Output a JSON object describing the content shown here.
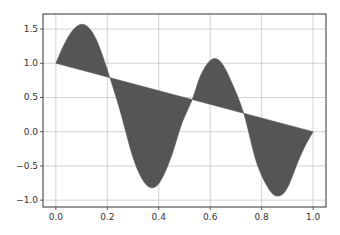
{
  "chart_data": {
    "type": "area",
    "title": "",
    "xlabel": "",
    "ylabel": "",
    "xlim": [
      -0.05,
      1.05
    ],
    "ylim": [
      -1.1,
      1.72
    ],
    "grid": true,
    "legend": null,
    "fill_color": "#555555",
    "x_ticks": [
      0.0,
      0.2,
      0.4,
      0.6,
      0.8,
      1.0
    ],
    "x_tick_labels": [
      "0.0",
      "0.2",
      "0.4",
      "0.6",
      "0.8",
      "1.0"
    ],
    "y_ticks": [
      -1.0,
      -0.5,
      0.0,
      0.5,
      1.0,
      1.5
    ],
    "y_tick_labels": [
      "−1.0",
      "−0.5",
      "0.0",
      "0.5",
      "1.0",
      "1.5"
    ],
    "series": [
      {
        "name": "curve",
        "x": [
          0.0,
          0.025,
          0.05,
          0.075,
          0.1,
          0.125,
          0.15,
          0.175,
          0.21,
          0.25,
          0.3,
          0.34,
          0.376,
          0.41,
          0.45,
          0.49,
          0.53,
          0.56,
          0.59,
          0.617,
          0.645,
          0.68,
          0.73,
          0.78,
          0.83,
          0.866,
          0.9,
          0.94,
          0.97,
          1.0
        ],
        "y": [
          1.0,
          1.22,
          1.4,
          1.52,
          1.57,
          1.53,
          1.4,
          1.18,
          0.79,
          0.3,
          -0.38,
          -0.72,
          -0.82,
          -0.7,
          -0.35,
          0.12,
          0.47,
          0.8,
          1.0,
          1.07,
          1.0,
          0.75,
          0.27,
          -0.45,
          -0.85,
          -0.94,
          -0.82,
          -0.45,
          -0.2,
          0.0
        ]
      },
      {
        "name": "line",
        "x": [
          0.0,
          1.0
        ],
        "y": [
          1.0,
          0.0
        ]
      }
    ]
  }
}
